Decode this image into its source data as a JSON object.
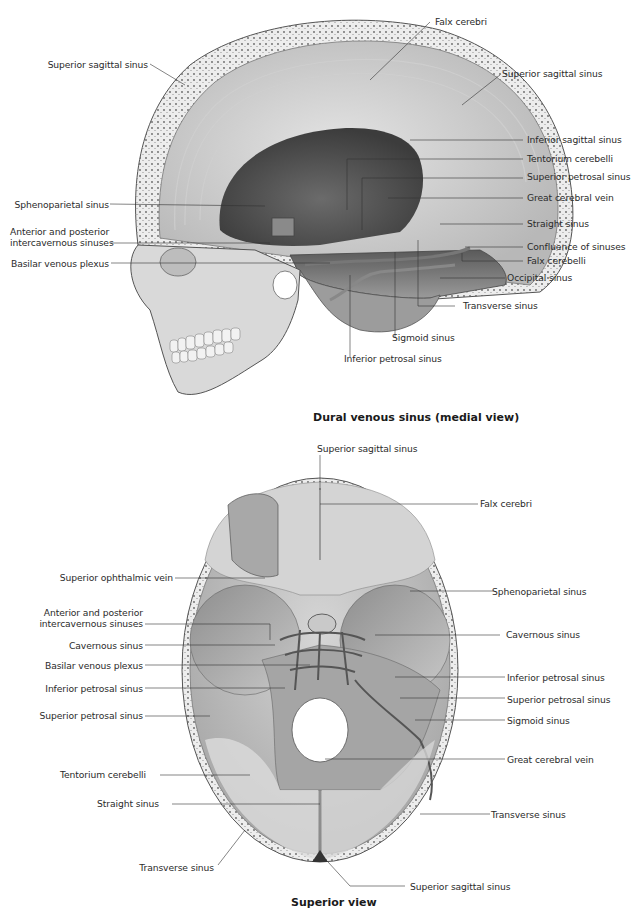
{
  "figures": [
    {
      "id": "medial",
      "caption": "Dural venous sinus (medial view)",
      "labels_left": [
        {
          "text": "Superior sagittal sinus"
        },
        {
          "text": "Sphenoparietal sinus"
        },
        {
          "text_line1": "Anterior and posterior",
          "text_line2": "intercavernous sinuses"
        },
        {
          "text": "Basilar venous plexus"
        }
      ],
      "labels_right": [
        {
          "text": "Falx cerebri"
        },
        {
          "text": "Superior sagittal sinus"
        },
        {
          "text": "Inferior sagittal sinus"
        },
        {
          "text": "Tentorium cerebelli"
        },
        {
          "text": "Superior petrosal sinus"
        },
        {
          "text": "Great cerebral vein"
        },
        {
          "text": "Straight sinus"
        },
        {
          "text": "Confluence of sinuses"
        },
        {
          "text": "Falx cerebelli"
        },
        {
          "text": "Occipital sinus"
        },
        {
          "text": "Transverse sinus"
        }
      ],
      "labels_bottom": [
        {
          "text": "Sigmoid sinus"
        },
        {
          "text": "Inferior petrosal sinus"
        }
      ]
    },
    {
      "id": "superior",
      "caption": "Superior view",
      "labels_top": [
        {
          "text": "Superior sagittal sinus"
        }
      ],
      "labels_left": [
        {
          "text": "Superior ophthalmic vein"
        },
        {
          "text_line1": "Anterior and posterior",
          "text_line2": "intercavernous sinuses"
        },
        {
          "text": "Cavernous sinus"
        },
        {
          "text": "Basilar venous plexus"
        },
        {
          "text": "Inferior petrosal sinus"
        },
        {
          "text": "Superior petrosal sinus"
        },
        {
          "text": "Tentorium cerebelli"
        },
        {
          "text": "Straight sinus"
        },
        {
          "text": "Transverse sinus"
        }
      ],
      "labels_right": [
        {
          "text": "Falx cerebri"
        },
        {
          "text": "Sphenoparietal sinus"
        },
        {
          "text": "Cavernous sinus"
        },
        {
          "text": "Inferior petrosal sinus"
        },
        {
          "text": "Superior petrosal sinus"
        },
        {
          "text": "Sigmoid sinus"
        },
        {
          "text": "Great cerebral vein"
        },
        {
          "text": "Transverse sinus"
        },
        {
          "text": "Superior sagittal sinus"
        }
      ]
    }
  ]
}
